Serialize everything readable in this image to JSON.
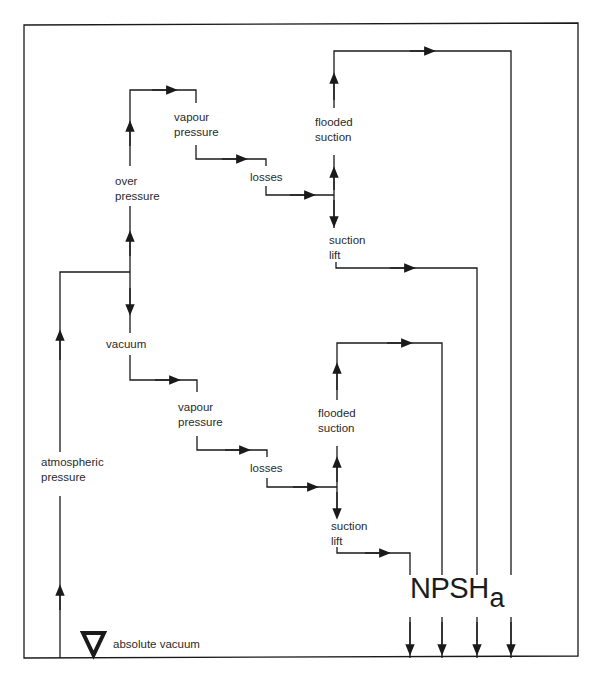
{
  "figure": {
    "type": "flow-diagram",
    "colors": {
      "line": "#1a1a1a",
      "text": "#2a2a2a",
      "background": "#ffffff"
    }
  },
  "labels": {
    "over_pressure": [
      "over",
      "pressure"
    ],
    "vacuum": "vacuum",
    "atmospheric_pressure": [
      "atmospheric",
      "pressure"
    ],
    "upper_vapour_pressure": [
      "vapour",
      "pressure"
    ],
    "upper_losses": "losses",
    "upper_flooded_suction": [
      "flooded",
      "suction"
    ],
    "upper_suction_lift": [
      "suction",
      "lift"
    ],
    "lower_vapour_pressure": [
      "vapour",
      "pressure"
    ],
    "lower_losses": "losses",
    "lower_flooded_suction": [
      "flooded",
      "suction"
    ],
    "lower_suction_lift": [
      "suction",
      "lift"
    ],
    "npsh_main": "NPSH",
    "npsh_sub": "a",
    "absolute_vacuum": "absolute vacuum"
  },
  "icons": {
    "datum": "inverted-triangle-icon",
    "arrow": "filled-arrowhead-icon"
  },
  "npsh_outputs": [
    {
      "source": "over pressure + flooded suction"
    },
    {
      "source": "over pressure + suction lift"
    },
    {
      "source": "vacuum + flooded suction"
    },
    {
      "source": "vacuum + suction lift"
    }
  ]
}
